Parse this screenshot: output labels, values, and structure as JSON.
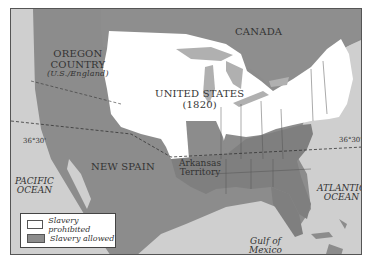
{
  "map": {
    "title_region": "Missouri Compromise era map, 1820",
    "colors": {
      "ocean": "#cfcfcf",
      "slavery_allowed": "#8c8c8c",
      "slavery_prohibited": "#ffffff",
      "foreign_land": "#8c8c8c",
      "lakes": "#b0b0b0",
      "border": "#555555"
    },
    "labels": {
      "oregon_line1": "OREGON",
      "oregon_line2": "COUNTRY",
      "oregon_sub": "(U.S./England)",
      "canada": "CANADA",
      "us_line1": "UNITED STATES",
      "us_line2": "(1820)",
      "new_spain": "NEW SPAIN",
      "arkansas_line1": "Arkansas",
      "arkansas_line2": "Territory",
      "pacific_line1": "PACIFIC",
      "pacific_line2": "OCEAN",
      "atlantic_line1": "ATLANTIC",
      "atlantic_line2": "OCEAN",
      "gulf_line1": "Gulf of",
      "gulf_line2": "Mexico",
      "lat_west": "36°30'",
      "lat_east": "36°30'"
    },
    "legend": {
      "items": [
        {
          "label": "Slavery prohibited",
          "color": "#ffffff"
        },
        {
          "label": "Slavery allowed",
          "color": "#8c8c8c"
        }
      ]
    }
  }
}
